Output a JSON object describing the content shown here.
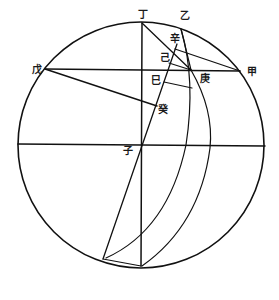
{
  "diagram": {
    "type": "geometric-astronomical-construction",
    "ink_color": "#111111",
    "background_color": "#ffffff",
    "circle": {
      "cx": 141,
      "cy": 145,
      "r": 123
    },
    "labels": [
      {
        "id": "ding",
        "text": "丁",
        "x": 138,
        "y": 18
      },
      {
        "id": "yi",
        "text": "乙",
        "x": 180,
        "y": 19
      },
      {
        "id": "xin",
        "text": "辛",
        "x": 170,
        "y": 42
      },
      {
        "id": "ji",
        "text": "己",
        "x": 160,
        "y": 61
      },
      {
        "id": "wu",
        "text": "戊",
        "x": 32,
        "y": 73
      },
      {
        "id": "jia",
        "text": "甲",
        "x": 247,
        "y": 75
      },
      {
        "id": "geng",
        "text": "庚",
        "x": 200,
        "y": 82
      },
      {
        "id": "si",
        "text": "巳",
        "x": 151,
        "y": 84
      },
      {
        "id": "gui",
        "text": "癸",
        "x": 158,
        "y": 113
      },
      {
        "id": "zi",
        "text": "子",
        "x": 123,
        "y": 154
      }
    ]
  }
}
